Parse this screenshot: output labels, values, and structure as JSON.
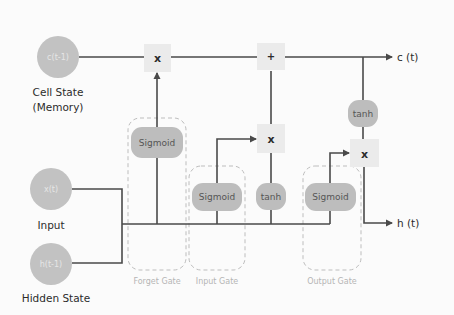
{
  "diagram": {
    "colors": {
      "background": "#fbfbfb",
      "line": "#4a4a4a",
      "node_fill": "#bdbdbd",
      "op_box_fill": "#ebebeb",
      "gate_border": "#b8b8b8"
    },
    "inputs": {
      "cell_state": {
        "symbol": "c(t-1)",
        "caption_line1": "Cell State",
        "caption_line2": "(Memory)"
      },
      "input": {
        "symbol": "x(t)",
        "caption": "Input"
      },
      "hidden": {
        "symbol": "h(t-1)",
        "caption": "Hidden State"
      }
    },
    "operations": {
      "forget_multiply": "x",
      "cell_add": "+",
      "input_multiply": "x",
      "output_multiply": "x"
    },
    "activations": {
      "forget_sigmoid": "Sigmoid",
      "input_sigmoid": "Sigmoid",
      "input_tanh": "tanh",
      "output_sigmoid": "Sigmoid",
      "output_tanh": "tanh"
    },
    "gates": {
      "forget": "Forget Gate",
      "input": "Input Gate",
      "output": "Output Gate"
    },
    "outputs": {
      "cell_state": "c (t)",
      "hidden": "h (t)"
    }
  }
}
